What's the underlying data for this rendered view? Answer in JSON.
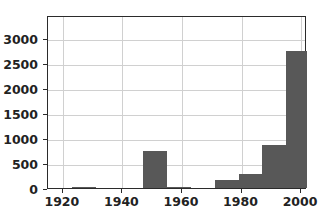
{
  "chart_data": {
    "type": "bar",
    "title": "",
    "xlabel": "",
    "ylabel": "",
    "xlim": [
      1915,
      2002
    ],
    "ylim": [
      0,
      3450
    ],
    "grid": true,
    "legend": null,
    "bar_color": "#585858",
    "xticks": [
      1920,
      1940,
      1960,
      1980,
      2000
    ],
    "xtick_labels": [
      "1920",
      "1940",
      "1960",
      "1980",
      "2000"
    ],
    "yticks": [
      0,
      500,
      1000,
      1500,
      2000,
      2500,
      3000
    ],
    "ytick_labels": [
      "0",
      "500",
      "1000",
      "1500",
      "2000",
      "2500",
      "3000"
    ],
    "bin_edges": [
      1915,
      1923,
      1931,
      1939,
      1947,
      1955,
      1963,
      1971,
      1979,
      1987,
      1995,
      2002
    ],
    "bins": [
      {
        "start": 1915,
        "end": 1923,
        "value": 0
      },
      {
        "start": 1923,
        "end": 1931,
        "value": 20
      },
      {
        "start": 1931,
        "end": 1939,
        "value": 0
      },
      {
        "start": 1939,
        "end": 1947,
        "value": 0
      },
      {
        "start": 1947,
        "end": 1955,
        "value": 730
      },
      {
        "start": 1955,
        "end": 1963,
        "value": 10
      },
      {
        "start": 1963,
        "end": 1971,
        "value": 0
      },
      {
        "start": 1971,
        "end": 1979,
        "value": 165
      },
      {
        "start": 1979,
        "end": 1987,
        "value": 275
      },
      {
        "start": 1987,
        "end": 1995,
        "value": 855
      },
      {
        "start": 1995,
        "end": 2002,
        "value": 2740
      },
      {
        "start": 2002,
        "end": 2010,
        "value": 3310
      }
    ]
  }
}
